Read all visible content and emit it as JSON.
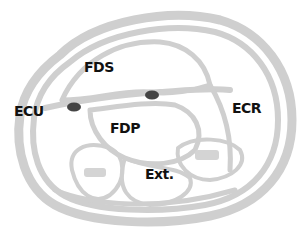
{
  "diagram": {
    "type": "anatomical cross-section",
    "labels": {
      "fds": "FDS",
      "ecu": "ECU",
      "fdp": "FDP",
      "ecr": "ECR",
      "ext": "Ext."
    },
    "colors": {
      "outline": "#c8c8c8",
      "label": "#111111",
      "dot": "#444444",
      "background": "#ffffff"
    }
  }
}
